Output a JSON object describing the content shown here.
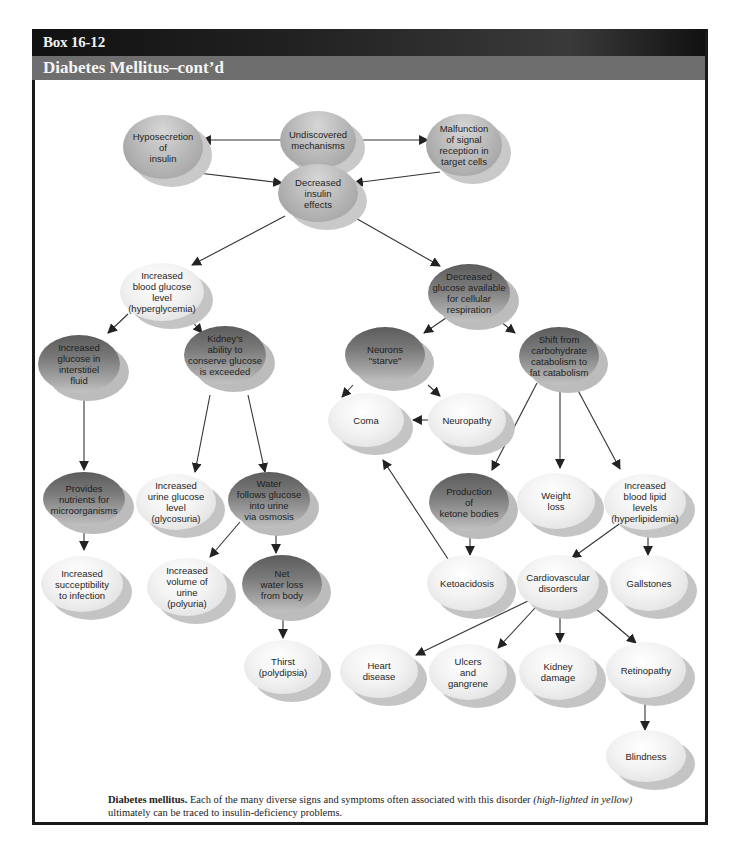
{
  "header": {
    "box_number": "Box 16-12",
    "title": "Diabetes Mellitus–cont’d"
  },
  "colors": {
    "header_black": "#111111",
    "header_grey": "#6e6e6e",
    "border": "#1a1a1a",
    "arrow": "#222222"
  },
  "nodes": {
    "hyposecretion": "Hyposecretion\nof\ninsulin",
    "undiscovered": "Undiscovered\nmechanisms",
    "malfunction": "Malfunction\nof signal\nreception in\ntarget cells",
    "decreased_insulin": "Decreased\ninsulin\neffects",
    "hyperglycemia": "Increased\nblood glucose\nlevel\n(hyperglycemia)",
    "decreased_glucose": "Decreased\nglucose available\nfor cellular\nrespiration",
    "interstitial": "Increased\nglucose in\ninterstitiel\nfluid",
    "kidney_ability": "Kidney's\nability to\nconserve glucose\nis exceeded",
    "neurons": "Neurons\n\"starve\"",
    "shift": "Shift from\ncarbohydrate\ncatabolism to\nfat catabolism",
    "coma": "Coma",
    "neuropathy": "Neuropathy",
    "nutrients": "Provides\nnutrients for\nmicroorganisms",
    "glycosuria": "Increased\nurine glucose\nlevel\n(glycosuria)",
    "water_follows": "Water\nfollows glucose\ninto urine\nvia osmosis",
    "ketone": "Production\nof\nketone bodies",
    "weight_loss": "Weight\nloss",
    "hyperlipidemia": "Increased\nblood lipid\nlevels\n(hyperlipidemia)",
    "susceptibility": "Increased\nsucceptibility\nto infection",
    "polyuria": "Increased\nvolume of\nurine\n(polyuria)",
    "net_water_loss": "Net\nwater loss\nfrom body",
    "ketoacidosis": "Ketoacidosis",
    "cardiovascular": "Cardiovascular\ndisorders",
    "gallstones": "Gallstones",
    "thirst": "Thirst\n(polydipsia)",
    "heart_disease": "Heart\ndisease",
    "ulcers": "Ulcers\nand\ngangrene",
    "kidney_damage": "Kidney\ndamage",
    "retinopathy": "Retinopathy",
    "blindness": "Blindness"
  },
  "caption": {
    "bold": "Diabetes mellitus.",
    "text1": " Each of the many diverse signs and symptoms often associated with this disorder ",
    "italic": "(high-lighted in yellow)",
    "text2": " ultimately can be traced to insulin-deficiency problems."
  }
}
